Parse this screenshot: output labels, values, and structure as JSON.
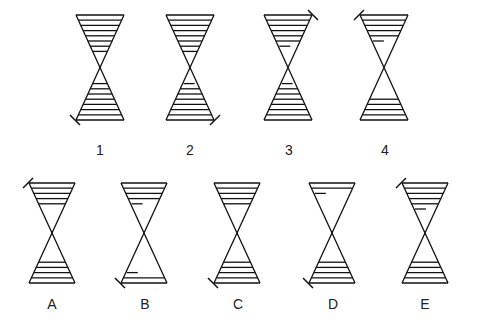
{
  "puzzle": {
    "sequence_labels": [
      "1",
      "2",
      "3",
      "4"
    ],
    "answer_labels": [
      "A",
      "B",
      "C",
      "D",
      "E"
    ]
  },
  "figures": [
    {
      "id": "1",
      "cx": 100,
      "top": 15,
      "bottom": 120,
      "hw": 24,
      "top_lines": 7,
      "top_short": 0,
      "bot_lines": 7,
      "bot_short": 0,
      "tick": "bl"
    },
    {
      "id": "2",
      "cx": 190,
      "top": 15,
      "bottom": 120,
      "hw": 24,
      "top_lines": 7,
      "top_short": 0,
      "bot_lines": 6,
      "bot_short": 1,
      "tick": "br"
    },
    {
      "id": "3",
      "cx": 288,
      "top": 15,
      "bottom": 120,
      "hw": 24,
      "top_lines": 5,
      "top_short": 1,
      "bot_lines": 6,
      "bot_short": 1,
      "tick": "tr"
    },
    {
      "id": "4",
      "cx": 384,
      "top": 15,
      "bottom": 120,
      "hw": 24,
      "top_lines": 4,
      "top_short": 1,
      "bot_lines": 4,
      "bot_short": 0,
      "tick": "tl"
    },
    {
      "id": "A",
      "cx": 52,
      "top": 183,
      "bottom": 283,
      "hw": 23,
      "top_lines": 4,
      "top_short": 0,
      "bot_lines": 4,
      "bot_short": 0,
      "tick": "tl"
    },
    {
      "id": "B",
      "cx": 144,
      "top": 183,
      "bottom": 283,
      "hw": 23,
      "top_lines": 3,
      "top_short": 1,
      "bot_lines": 1,
      "bot_short": 1,
      "tick": "bl"
    },
    {
      "id": "C",
      "cx": 237,
      "top": 183,
      "bottom": 283,
      "hw": 23,
      "top_lines": 4,
      "top_short": 0,
      "bot_lines": 4,
      "bot_short": 0,
      "tick": "bl"
    },
    {
      "id": "D",
      "cx": 332,
      "top": 183,
      "bottom": 283,
      "hw": 23,
      "top_lines": 1,
      "top_short": 1,
      "bot_lines": 4,
      "bot_short": 0,
      "tick": "bl"
    },
    {
      "id": "E",
      "cx": 425,
      "top": 183,
      "bottom": 283,
      "hw": 23,
      "top_lines": 4,
      "top_short": 1,
      "bot_lines": 4,
      "bot_short": 0,
      "tick": "tl"
    }
  ],
  "label_positions": [
    {
      "text": "1",
      "x": 90,
      "y": 142
    },
    {
      "text": "2",
      "x": 180,
      "y": 142
    },
    {
      "text": "3",
      "x": 279,
      "y": 142
    },
    {
      "text": "4",
      "x": 375,
      "y": 142
    },
    {
      "text": "A",
      "x": 42,
      "y": 296
    },
    {
      "text": "B",
      "x": 135,
      "y": 296
    },
    {
      "text": "C",
      "x": 228,
      "y": 296
    },
    {
      "text": "D",
      "x": 323,
      "y": 296
    },
    {
      "text": "E",
      "x": 415,
      "y": 296
    }
  ]
}
